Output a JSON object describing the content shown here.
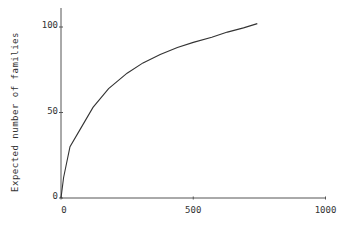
{
  "chart_data": {
    "type": "line",
    "title": "",
    "xlabel": "",
    "ylabel": "Expected number of families",
    "xlim": [
      0,
      1000
    ],
    "ylim": [
      0,
      110
    ],
    "xticks": [
      "0",
      "500",
      "1000"
    ],
    "yticks": [
      "0",
      "50",
      "100"
    ],
    "grid": false,
    "legend": null,
    "series": [
      {
        "name": "rarefaction curve",
        "x": [
          0,
          10,
          34,
          72,
          121,
          180,
          250,
          310,
          375,
          440,
          500,
          570,
          629,
          690,
          742
        ],
        "y": [
          0,
          12,
          30,
          40,
          53,
          64,
          73,
          79,
          84,
          88,
          91,
          94,
          97,
          99.5,
          102
        ]
      }
    ]
  }
}
